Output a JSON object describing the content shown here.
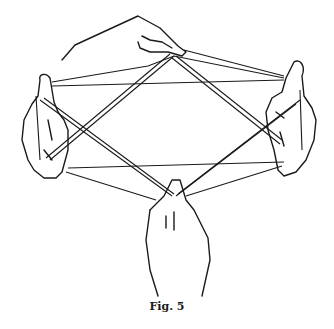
{
  "figure": {
    "caption": "Fig. 5"
  }
}
